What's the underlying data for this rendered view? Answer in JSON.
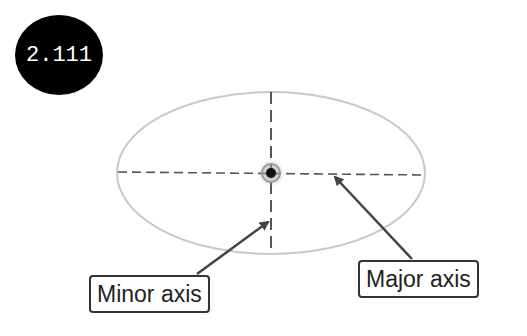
{
  "badge": {
    "text": "2.111",
    "color": "#000000",
    "text_color": "#ffffff"
  },
  "diagram": {
    "ellipse": {
      "cx": 271,
      "cy": 173,
      "rx": 154,
      "ry": 81,
      "stroke": "#c8c8c8"
    },
    "center_point": {
      "cx": 271,
      "cy": 173
    },
    "axes": {
      "stroke": "#555555",
      "dash": "9 5"
    }
  },
  "labels": {
    "minor_axis": "Minor axis",
    "major_axis": "Major axis"
  }
}
